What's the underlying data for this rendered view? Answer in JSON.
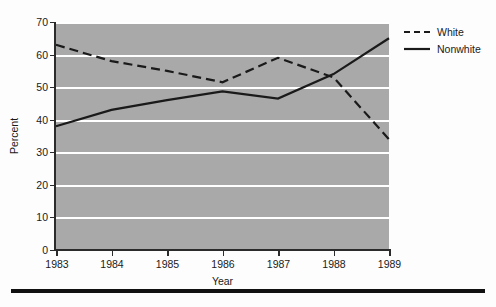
{
  "chart_data": {
    "type": "line",
    "title": "",
    "xlabel": "Year",
    "ylabel": "Percent",
    "x": [
      1983,
      1984,
      1985,
      1986,
      1987,
      1988,
      1989
    ],
    "xtick_labels": [
      "1983",
      "1984",
      "1985",
      "1986",
      "1987",
      "1988",
      "1989"
    ],
    "ytick_labels": [
      "0",
      "10",
      "20",
      "30",
      "40",
      "50",
      "60",
      "70"
    ],
    "yticks": [
      0,
      10,
      20,
      30,
      40,
      50,
      60,
      70
    ],
    "ylim": [
      0,
      70
    ],
    "xlim": [
      1983,
      1989
    ],
    "grid": "horizontal",
    "plot_background": "#a9a9a9",
    "gridline_color": "#ffffff",
    "line_color": "#1a1a1a",
    "legend_position": "outside-top-right",
    "series": [
      {
        "name": "White",
        "style": "dashed",
        "values": [
          63,
          58,
          55,
          51.5,
          59,
          53,
          34
        ]
      },
      {
        "name": "Nonwhite",
        "style": "solid",
        "values": [
          38,
          43,
          46,
          48.7,
          46.5,
          54,
          65
        ]
      }
    ]
  },
  "legend": {
    "items": [
      {
        "label": "White",
        "style": "dashed"
      },
      {
        "label": "Nonwhite",
        "style": "solid"
      }
    ]
  },
  "axes": {
    "y_title": "Percent",
    "x_title": "Year"
  }
}
